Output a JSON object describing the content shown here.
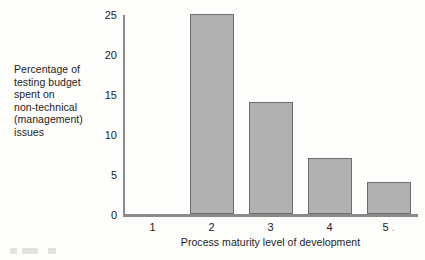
{
  "chart_data": {
    "type": "bar",
    "title": "",
    "subtitle": "",
    "categories": [
      "1",
      "2",
      "3",
      "4",
      "5"
    ],
    "values": [
      0,
      25,
      14,
      7,
      4
    ],
    "series": [
      {
        "name": "Percentage of testing budget spent on non-technical (management) issues",
        "values": [
          0,
          25,
          14,
          7,
          4
        ]
      }
    ],
    "xlabel": "Process maturity level of development",
    "ylabel": "Percentage of testing budget spent on non-technical (management) issues",
    "ylabel_lines": [
      "Percentage of",
      "testing budget",
      "spent on",
      "non-technical",
      "(management)",
      "issues"
    ],
    "ylim": [
      0,
      25
    ],
    "xlim": [
      0.5,
      5.5
    ],
    "yticks": [
      0,
      5,
      10,
      15,
      20,
      25
    ],
    "ytick_labels": [
      "0",
      "5",
      "10",
      "15",
      "20",
      "25"
    ],
    "xtick_labels": [
      "1",
      "2",
      "3",
      "4",
      "5"
    ],
    "xtick_trailing_marks": [
      "",
      "",
      "",
      "",
      "."
    ],
    "grid": false,
    "legend": false,
    "legend_position": "none",
    "colors": {
      "bar_fill": "#b1b1b1",
      "bar_border": "#6d6d6d",
      "axis": "#8a8a8a",
      "text": "#1c1c1c",
      "background": "#fdfdfc"
    }
  }
}
